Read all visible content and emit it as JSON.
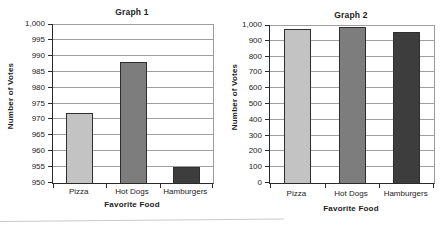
{
  "page": {
    "background": "#ffffff",
    "text_color": "#1c1c1c",
    "gridline_color": "#9f9f9f",
    "axis_color": "#2a2a2a"
  },
  "chart_data": [
    {
      "type": "bar",
      "title": "Graph 1",
      "xlabel": "Favorite Food",
      "ylabel": "Number of Votes",
      "categories": [
        "Pizza",
        "Hot Dogs",
        "Hamburgers"
      ],
      "values": [
        972,
        988,
        955
      ],
      "ylim": [
        950,
        1000
      ],
      "ytick_step": 5,
      "ytick_labels": [
        "950",
        "955",
        "960",
        "965",
        "970",
        "975",
        "980",
        "985",
        "990",
        "995",
        "1,000"
      ],
      "bar_colors": [
        "#c3c3c3",
        "#7d7d7d",
        "#3d3d3d"
      ],
      "grid": "horizontal",
      "legend": "none"
    },
    {
      "type": "bar",
      "title": "Graph 2",
      "xlabel": "Favorite Food",
      "ylabel": "Number of Votes",
      "categories": [
        "Pizza",
        "Hot Dogs",
        "Hamburgers"
      ],
      "values": [
        972,
        988,
        955
      ],
      "ylim": [
        0,
        1000
      ],
      "ytick_step": 100,
      "ytick_labels": [
        "0",
        "100",
        "200",
        "300",
        "400",
        "500",
        "600",
        "700",
        "800",
        "900",
        "1,000"
      ],
      "bar_colors": [
        "#c3c3c3",
        "#7d7d7d",
        "#3d3d3d"
      ],
      "grid": "horizontal",
      "legend": "none"
    }
  ]
}
